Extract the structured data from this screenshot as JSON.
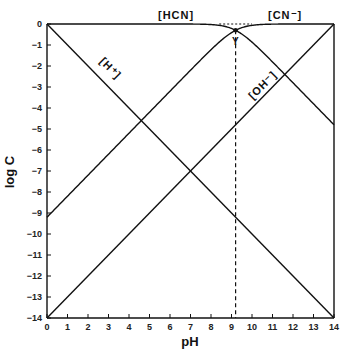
{
  "chart_data": {
    "type": "line",
    "title": "",
    "xlabel": "pH",
    "ylabel": "log C",
    "xlim": [
      0,
      14
    ],
    "ylim": [
      -14,
      0
    ],
    "grid": false,
    "x_ticks": [
      "0",
      "1",
      "2",
      "3",
      "4",
      "5",
      "6",
      "7",
      "8",
      "9",
      "10",
      "11",
      "12",
      "13",
      "14"
    ],
    "y_ticks": [
      "0",
      "-1",
      "-2",
      "-3",
      "-4",
      "-5",
      "-6",
      "-7",
      "-8",
      "-9",
      "-10",
      "-11",
      "-12",
      "-13",
      "-14"
    ],
    "pKa": 9.2,
    "total_log_C": 0,
    "series": [
      {
        "name": "[HCN]",
        "x": [
          0,
          9.2,
          14
        ],
        "values": [
          0,
          -0.3,
          -4.8
        ],
        "label_pos": {
          "pH": 6.9,
          "logC": 0.5
        }
      },
      {
        "name": "[CN⁻]",
        "x": [
          0,
          9.2,
          14
        ],
        "values": [
          -9.2,
          -0.3,
          0
        ],
        "label_pos": {
          "pH": 11.5,
          "logC": 0.5
        }
      },
      {
        "name": "[H⁺]",
        "x": [
          0,
          14
        ],
        "values": [
          0,
          -14
        ],
        "label_pos": {
          "pH": 3.0,
          "logC": -2.3
        }
      },
      {
        "name": "[OH⁻]",
        "x": [
          0,
          14
        ],
        "values": [
          -14,
          0
        ],
        "label_pos": {
          "pH": 10.9,
          "logC": -4.0
        }
      }
    ],
    "annotations": [
      {
        "type": "vertical_dashed_line",
        "pH": 9.2,
        "label": "pKa"
      },
      {
        "type": "horizontal_dashed_segment",
        "logC": 0,
        "pH_range": [
          8.4,
          10.0
        ]
      },
      {
        "type": "system_point",
        "pH": 9.2,
        "logC": -0.3,
        "marker": "Y"
      }
    ]
  },
  "labels": {
    "hcn": "[HCN]",
    "cn": "[CN⁻]",
    "h": "[H⁺]",
    "oh": "[OH⁻]",
    "xlabel": "pH",
    "ylabel": "log C",
    "marker": "Y"
  }
}
